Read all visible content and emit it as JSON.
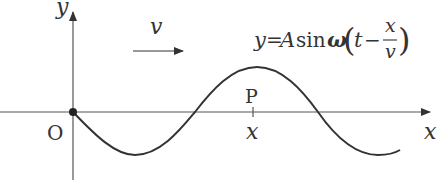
{
  "diagram": {
    "type": "transverse wave graph",
    "axes": {
      "x_label": "x",
      "y_label": "y",
      "origin_label": "O"
    },
    "velocity": {
      "label": "v",
      "direction": "right"
    },
    "point": {
      "label": "P",
      "position_label": "x"
    },
    "equation": {
      "lhs": "y",
      "eq": "=",
      "amp": "A",
      "func": "sin",
      "omega": "ω",
      "lparen": "(",
      "t": "t",
      "minus": "−",
      "num": "x",
      "den": "v",
      "rparen": ")",
      "full_text": "y=Asinω(t − x/v)"
    },
    "wave": {
      "shape": "sinusoid starting at origin going downward",
      "colors": {
        "stroke": "#333333",
        "axis": "#555555"
      }
    }
  }
}
